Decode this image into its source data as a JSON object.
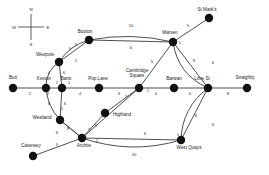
{
  "diagram": {
    "background": "#ffffff",
    "edge_color": "#3b3b3b",
    "node_color": "#111111",
    "label_color": "#1a1a1a"
  },
  "compass": {
    "name": "compass-rose",
    "north": "N",
    "east": "E",
    "south": "S",
    "west": "W",
    "cx": 31,
    "cy": 27,
    "arm": 13
  },
  "chart_data": {
    "type": "diagram",
    "nodes": [
      {
        "id": "buti",
        "label": "Buti",
        "x": 13,
        "y": 88,
        "lx": 13,
        "ly": 79,
        "anchor": "middle"
      },
      {
        "id": "kexton",
        "label": "Kexton",
        "x": 46,
        "y": 88,
        "lx": 44,
        "ly": 80,
        "anchor": "middle"
      },
      {
        "id": "barts",
        "label": "Barts",
        "x": 62,
        "y": 88,
        "lx": 66,
        "ly": 80,
        "anchor": "middle"
      },
      {
        "id": "weopole",
        "label": "Weopole",
        "x": 59,
        "y": 62,
        "lx": 45,
        "ly": 56,
        "anchor": "middle"
      },
      {
        "id": "booton",
        "label": "Booton",
        "x": 89,
        "y": 40,
        "lx": 85,
        "ly": 33,
        "anchor": "middle"
      },
      {
        "id": "marven",
        "label": "Marven",
        "x": 173,
        "y": 42,
        "lx": 170,
        "ly": 34,
        "anchor": "middle"
      },
      {
        "id": "stmarks",
        "label": "St Mark's",
        "x": 209,
        "y": 18,
        "lx": 207,
        "ly": 11,
        "anchor": "middle"
      },
      {
        "id": "poplane",
        "label": "Pop Lane",
        "x": 99,
        "y": 88,
        "lx": 98,
        "ly": 80,
        "anchor": "middle"
      },
      {
        "id": "cambridge",
        "label": "Cambridge Square",
        "x": 139,
        "y": 88,
        "lx": 137,
        "ly": 72,
        "anchor": "middle"
      },
      {
        "id": "barwan",
        "label": "Barwan",
        "x": 174,
        "y": 88,
        "lx": 174,
        "ly": 80,
        "anchor": "middle"
      },
      {
        "id": "limest",
        "label": "Lime St",
        "x": 208,
        "y": 88,
        "lx": 202,
        "ly": 80,
        "anchor": "middle"
      },
      {
        "id": "straightly",
        "label": "Straightly",
        "x": 247,
        "y": 88,
        "lx": 245,
        "ly": 79,
        "anchor": "middle"
      },
      {
        "id": "westland",
        "label": "Westland",
        "x": 60,
        "y": 120,
        "lx": 42,
        "ly": 119,
        "anchor": "middle"
      },
      {
        "id": "highland",
        "label": "Highland",
        "x": 105,
        "y": 113,
        "lx": 122,
        "ly": 116,
        "anchor": "middle"
      },
      {
        "id": "archite",
        "label": "Archite",
        "x": 82,
        "y": 138,
        "lx": 84,
        "ly": 147,
        "anchor": "middle"
      },
      {
        "id": "catensey",
        "label": "Catensey",
        "x": 33,
        "y": 156,
        "lx": 31,
        "ly": 147,
        "anchor": "middle"
      },
      {
        "id": "westquays",
        "label": "West Quays",
        "x": 181,
        "y": 140,
        "lx": 189,
        "ly": 149,
        "anchor": "middle"
      }
    ],
    "edges": [
      {
        "from": "buti",
        "to": "kexton",
        "weight": "2",
        "wx": 30,
        "wy": 95,
        "curve": 0
      },
      {
        "from": "kexton",
        "to": "barts",
        "weight": "",
        "wx": 0,
        "wy": 0,
        "curve": 0
      },
      {
        "from": "kexton",
        "to": "weopole",
        "weight": "4",
        "wx": 49,
        "wy": 74,
        "curve": -8
      },
      {
        "from": "barts",
        "to": "weopole",
        "weight": "6",
        "wx": 64,
        "wy": 74,
        "curve": 0
      },
      {
        "from": "weopole",
        "to": "booton",
        "weight": "5",
        "wx": 70,
        "wy": 50,
        "curve": -7
      },
      {
        "from": "booton",
        "to": "marven",
        "weight": "10",
        "wx": 131,
        "wy": 27,
        "curve": -9
      },
      {
        "from": "booton",
        "to": "marven",
        "weight": "6",
        "wx": 131,
        "wy": 49,
        "curve": 0
      },
      {
        "from": "booton",
        "to": "weopole",
        "weight": "5",
        "wx": 76,
        "wy": 46,
        "curve": 0
      },
      {
        "from": "marven",
        "to": "stmarks",
        "weight": "5",
        "wx": 188,
        "wy": 27,
        "curve": 0
      },
      {
        "from": "marven",
        "to": "limest",
        "weight": "6",
        "wx": 213,
        "wy": 64,
        "curve": 0
      },
      {
        "from": "marven",
        "to": "limest",
        "weight": "8",
        "wx": 194,
        "wy": 62,
        "curve": 16
      },
      {
        "from": "marven",
        "to": "cambridge",
        "weight": "5",
        "wx": 152,
        "wy": 63,
        "curve": 0
      },
      {
        "from": "barts",
        "to": "poplane",
        "weight": "4",
        "wx": 80,
        "wy": 95,
        "curve": 0
      },
      {
        "from": "poplane",
        "to": "cambridge",
        "weight": "4",
        "wx": 119,
        "wy": 95,
        "curve": 0
      },
      {
        "from": "cambridge",
        "to": "barwan",
        "weight": "4",
        "wx": 156,
        "wy": 95,
        "curve": 0
      },
      {
        "from": "barwan",
        "to": "limest",
        "weight": "6",
        "wx": 190,
        "wy": 95,
        "curve": 0
      },
      {
        "from": "limest",
        "to": "straightly",
        "weight": "8",
        "wx": 228,
        "wy": 95,
        "curve": 0
      },
      {
        "from": "barts",
        "to": "westland",
        "weight": "6",
        "wx": 65,
        "wy": 105,
        "curve": 0
      },
      {
        "from": "kexton",
        "to": "westland",
        "weight": "8",
        "wx": 49,
        "wy": 105,
        "curve": 6
      },
      {
        "from": "westland",
        "to": "archite",
        "weight": "8",
        "wx": 68,
        "wy": 130,
        "curve": 0
      },
      {
        "from": "westland",
        "to": "archite",
        "weight": "6",
        "wx": 57,
        "wy": 134,
        "curve": 0
      },
      {
        "from": "archite",
        "to": "highland",
        "weight": "5",
        "wx": 96,
        "wy": 127,
        "curve": 0
      },
      {
        "from": "highland",
        "to": "cambridge",
        "weight": "7",
        "wx": 126,
        "wy": 98,
        "curve": 0
      },
      {
        "from": "archite",
        "to": "catensey",
        "weight": "5",
        "wx": 57,
        "wy": 146,
        "curve": 0
      },
      {
        "from": "archite",
        "to": "westquays",
        "weight": "6",
        "wx": 145,
        "wy": 135,
        "curve": 0
      },
      {
        "from": "archite",
        "to": "westquays",
        "weight": "10",
        "wx": 134,
        "wy": 156,
        "curve": 16
      },
      {
        "from": "westquays",
        "to": "limest",
        "weight": "6",
        "wx": 213,
        "wy": 126,
        "curve": 0
      },
      {
        "from": "westquays",
        "to": "limest",
        "weight": "8",
        "wx": 196,
        "wy": 117,
        "curve": -14
      },
      {
        "from": "cambridge",
        "to": "archite",
        "weight": "7",
        "wx": 89,
        "wy": 131,
        "curve": 0
      }
    ],
    "weight_labels_extra": [
      {
        "text": "2",
        "x": 48,
        "y": 95
      },
      {
        "text": "1",
        "x": 57,
        "y": 84
      },
      {
        "text": "1",
        "x": 69,
        "y": 84
      },
      {
        "text": "1",
        "x": 76,
        "y": 62
      },
      {
        "text": "1",
        "x": 148,
        "y": 92
      },
      {
        "text": "1",
        "x": 97,
        "y": 142
      },
      {
        "text": "1",
        "x": 205,
        "y": 92
      },
      {
        "text": "1",
        "x": 178,
        "y": 136
      },
      {
        "text": "1",
        "x": 180,
        "y": 44
      },
      {
        "text": "1",
        "x": 62,
        "y": 110
      }
    ]
  }
}
